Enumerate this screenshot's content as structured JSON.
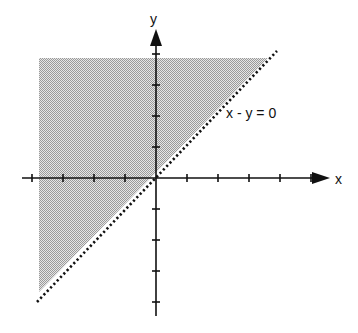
{
  "diagram": {
    "type": "inequality-graph",
    "axes": {
      "x_label": "x",
      "y_label": "y",
      "origin_px": [
        156,
        178
      ],
      "tick_spacing_px": 31,
      "x_ticks": [
        -4,
        -3,
        -2,
        -1,
        1,
        2,
        3,
        4,
        5
      ],
      "y_ticks": [
        -4,
        -3,
        -2,
        -1,
        1,
        2,
        3,
        4
      ]
    },
    "boundary": {
      "equation_label": "x - y = 0",
      "style": "dotted"
    },
    "shaded_region": {
      "description": "region above/left of line x - y = 0 (y > x)",
      "fill_color": "#c8c8c8"
    },
    "colors": {
      "axis": "#111111",
      "boundary": "#111111",
      "shade": "#c8c8c8",
      "background": "#ffffff"
    }
  }
}
